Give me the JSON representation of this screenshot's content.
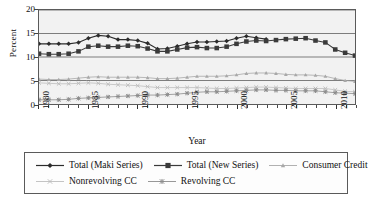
{
  "chart_data": {
    "type": "line",
    "title": "",
    "xlabel": "Year",
    "ylabel": "Percent",
    "xlim": [
      1980,
      2012
    ],
    "ylim": [
      0,
      20
    ],
    "yticks": [
      0,
      5,
      10,
      15,
      20
    ],
    "xticks_major": [
      1980,
      1985,
      1990,
      1995,
      2000,
      2005,
      2010
    ],
    "xtick_labels": [
      "1980",
      "1985",
      "1990",
      "1995",
      "2000",
      "2005",
      "2010"
    ],
    "grid": "horizontal",
    "legend_position": "below",
    "x": [
      1980,
      1981,
      1982,
      1983,
      1984,
      1985,
      1986,
      1987,
      1988,
      1989,
      1990,
      1991,
      1992,
      1993,
      1994,
      1995,
      1996,
      1997,
      1998,
      1999,
      2000,
      2001,
      2002,
      2003,
      2004,
      2005,
      2006,
      2007,
      2008,
      2009,
      2010,
      2011,
      2012
    ],
    "series": [
      {
        "name": "Total (Maki Series)",
        "marker": "diamond",
        "color": "#2b2b2b",
        "values": [
          12.8,
          12.8,
          12.8,
          12.8,
          13.1,
          14.0,
          14.6,
          14.4,
          13.7,
          13.7,
          13.5,
          12.9,
          11.7,
          11.8,
          12.3,
          12.8,
          13.2,
          13.2,
          13.3,
          13.4,
          14.0,
          14.4,
          14.1,
          13.8,
          null,
          null,
          null,
          null,
          null,
          null,
          null,
          null,
          null
        ]
      },
      {
        "name": "Total (New Series)",
        "marker": "square",
        "color": "#3a3a3a",
        "values": [
          10.7,
          10.6,
          10.6,
          10.7,
          11.2,
          12.2,
          12.4,
          12.2,
          12.2,
          12.4,
          12.3,
          11.8,
          11.2,
          11.2,
          11.6,
          12.0,
          12.1,
          11.9,
          11.9,
          12.2,
          12.8,
          13.3,
          13.5,
          13.4,
          13.6,
          13.8,
          13.9,
          14.0,
          13.5,
          13.1,
          11.6,
          10.9,
          10.3
        ]
      },
      {
        "name": "Consumer Credit",
        "marker": "triangle",
        "color": "#a8a8a8",
        "values": [
          5.3,
          5.2,
          5.2,
          5.3,
          5.5,
          5.7,
          5.8,
          5.7,
          5.7,
          5.7,
          5.7,
          5.6,
          5.4,
          5.4,
          5.5,
          5.7,
          5.9,
          5.9,
          5.9,
          6.0,
          6.2,
          6.5,
          6.6,
          6.6,
          6.5,
          6.3,
          6.2,
          6.2,
          6.1,
          5.9,
          5.4,
          5.0,
          4.8
        ]
      },
      {
        "name": "Nonrevolving CC",
        "marker": "x",
        "color": "#bdbdbd",
        "values": [
          4.5,
          4.4,
          4.3,
          4.3,
          4.4,
          4.5,
          4.4,
          4.2,
          4.1,
          4.0,
          3.9,
          3.7,
          3.5,
          3.5,
          3.5,
          3.5,
          3.5,
          3.4,
          3.3,
          3.3,
          3.4,
          3.5,
          3.6,
          3.6,
          3.5,
          3.4,
          3.3,
          3.3,
          3.3,
          3.3,
          3.0,
          2.7,
          2.6
        ]
      },
      {
        "name": "Revolving CC",
        "marker": "asterisk",
        "color": "#8c8c8c",
        "values": [
          0.9,
          0.9,
          0.9,
          1.0,
          1.2,
          1.3,
          1.4,
          1.5,
          1.6,
          1.7,
          1.8,
          1.9,
          1.9,
          2.0,
          2.1,
          2.3,
          2.5,
          2.6,
          2.6,
          2.7,
          2.8,
          2.9,
          3.0,
          3.0,
          2.9,
          2.9,
          2.8,
          2.8,
          2.8,
          2.6,
          2.4,
          2.3,
          2.2
        ]
      }
    ]
  },
  "legend": {
    "rows": [
      [
        {
          "label": "Total (Maki Series)",
          "marker": "diamond",
          "color": "#2b2b2b"
        },
        {
          "label": "Total (New Series)",
          "marker": "square",
          "color": "#3a3a3a"
        },
        {
          "label": "Consumer Credit",
          "marker": "triangle",
          "color": "#a8a8a8"
        }
      ],
      [
        {
          "label": "Nonrevolving CC",
          "marker": "x",
          "color": "#bdbdbd"
        },
        {
          "label": "Revolving CC",
          "marker": "asterisk",
          "color": "#8c8c8c"
        }
      ]
    ]
  },
  "style": {
    "plot_background": "#f2f2f2",
    "gridline_color": "#6e6e6e",
    "axis_color": "#5a5a5a",
    "page_background": "#ffffff"
  }
}
